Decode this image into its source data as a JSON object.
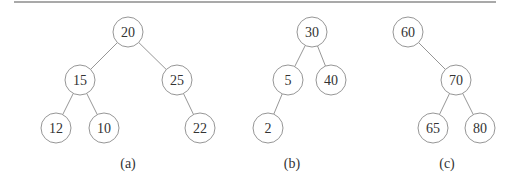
{
  "figure": {
    "node_radius": 15,
    "colors": {
      "stroke": "#8a8a8a",
      "text": "#333333",
      "rule": "#555555",
      "background": "#ffffff"
    },
    "top_rule": {
      "x1": 14,
      "x2": 496,
      "y": 2
    },
    "trees": [
      {
        "caption": "(a)",
        "caption_pos": {
          "x": 128,
          "y": 163
        },
        "nodes": [
          {
            "id": "a20",
            "label": "20",
            "x": 128,
            "y": 32
          },
          {
            "id": "a15",
            "label": "15",
            "x": 80,
            "y": 80
          },
          {
            "id": "a25",
            "label": "25",
            "x": 177,
            "y": 80
          },
          {
            "id": "a12",
            "label": "12",
            "x": 56,
            "y": 128
          },
          {
            "id": "a10",
            "label": "10",
            "x": 104,
            "y": 128
          },
          {
            "id": "a22",
            "label": "22",
            "x": 200,
            "y": 128
          }
        ],
        "edges": [
          [
            "a20",
            "a15"
          ],
          [
            "a20",
            "a25"
          ],
          [
            "a15",
            "a12"
          ],
          [
            "a15",
            "a10"
          ],
          [
            "a25",
            "a22"
          ]
        ]
      },
      {
        "caption": "(b)",
        "caption_pos": {
          "x": 292,
          "y": 163
        },
        "nodes": [
          {
            "id": "b30",
            "label": "30",
            "x": 312,
            "y": 32
          },
          {
            "id": "b5",
            "label": "5",
            "x": 288,
            "y": 80
          },
          {
            "id": "b40",
            "label": "40",
            "x": 331,
            "y": 80
          },
          {
            "id": "b2",
            "label": "2",
            "x": 268,
            "y": 128
          }
        ],
        "edges": [
          [
            "b30",
            "b5"
          ],
          [
            "b30",
            "b40"
          ],
          [
            "b5",
            "b2"
          ]
        ]
      },
      {
        "caption": "(c)",
        "caption_pos": {
          "x": 447,
          "y": 163
        },
        "nodes": [
          {
            "id": "c60",
            "label": "60",
            "x": 408,
            "y": 32
          },
          {
            "id": "c70",
            "label": "70",
            "x": 456,
            "y": 80
          },
          {
            "id": "c65",
            "label": "65",
            "x": 433,
            "y": 128
          },
          {
            "id": "c80",
            "label": "80",
            "x": 480,
            "y": 128
          }
        ],
        "edges": [
          [
            "c60",
            "c70"
          ],
          [
            "c70",
            "c65"
          ],
          [
            "c70",
            "c80"
          ]
        ]
      }
    ]
  }
}
